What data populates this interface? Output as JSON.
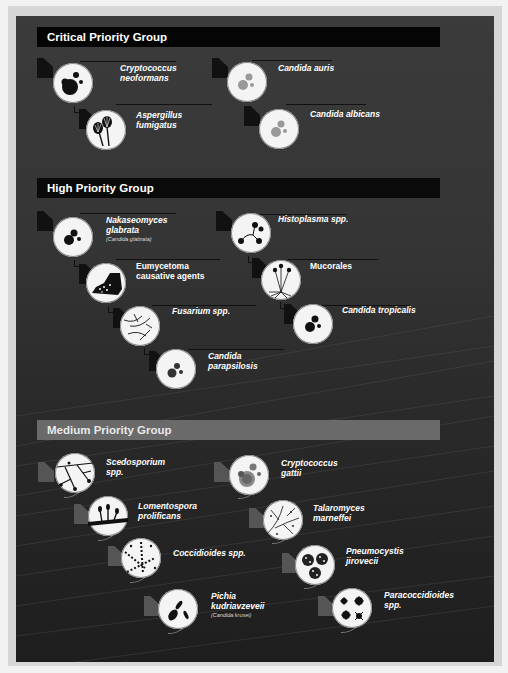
{
  "groups": [
    {
      "id": "critical",
      "title": "Critical Priority Group",
      "items": [
        {
          "name": "Cryptococcus",
          "name2": "neoformans",
          "sub": "",
          "icon": "cryptococcus-icon"
        },
        {
          "name": "Aspergillus",
          "name2": "fumigatus",
          "sub": "",
          "icon": "aspergillus-icon"
        },
        {
          "name": "Candida auris",
          "name2": "",
          "sub": "",
          "icon": "candida-icon"
        },
        {
          "name": "Candida albicans",
          "name2": "",
          "sub": "",
          "icon": "candida-icon"
        }
      ]
    },
    {
      "id": "high",
      "title": "High Priority Group",
      "items": [
        {
          "name": "Nakaseomyces",
          "name2": "glabrata",
          "sub": "(Candida glabrata)",
          "icon": "yeast-icon"
        },
        {
          "name": "Eumycetoma",
          "name2": "causative agents",
          "sub": "",
          "icon": "foot-icon"
        },
        {
          "name": "Fusarium spp.",
          "name2": "",
          "sub": "",
          "icon": "fusarium-icon"
        },
        {
          "name": "Candida",
          "name2": "parapsilosis",
          "sub": "",
          "icon": "yeast-icon"
        },
        {
          "name": "Histoplasma spp.",
          "name2": "",
          "sub": "",
          "icon": "histoplasma-icon"
        },
        {
          "name": "Mucorales",
          "name2": "",
          "sub": "",
          "icon": "mucorales-icon"
        },
        {
          "name": "Candida tropicalis",
          "name2": "",
          "sub": "",
          "icon": "yeast-icon"
        }
      ]
    },
    {
      "id": "medium",
      "title": "Medium Priority Group",
      "items": [
        {
          "name": "Scedosporium",
          "name2": "spp.",
          "sub": "",
          "icon": "scedosporium-icon"
        },
        {
          "name": "Lomentospora",
          "name2": "prolificans",
          "sub": "",
          "icon": "lomentospora-icon"
        },
        {
          "name": "Coccidioides spp.",
          "name2": "",
          "sub": "",
          "icon": "coccidioides-icon"
        },
        {
          "name": "Pichia",
          "name2": "kudriavzeveii",
          "sub": "(Candida krusei)",
          "icon": "pichia-icon"
        },
        {
          "name": "Cryptococcus",
          "name2": "gattii",
          "sub": "",
          "icon": "cryptococcus-gattii-icon"
        },
        {
          "name": "Talaromyces",
          "name2": "marneffei",
          "sub": "",
          "icon": "talaromyces-icon"
        },
        {
          "name": "Pneumocystis",
          "name2": "jirovecii",
          "sub": "",
          "icon": "pneumocystis-icon"
        },
        {
          "name": "Paracoccidioides",
          "name2": "spp.",
          "sub": "",
          "icon": "paracoccidioides-icon"
        }
      ]
    }
  ],
  "colors": {
    "panel_top": "#3b3b3b",
    "panel_bottom": "#1e1e1e",
    "critical_header": "#050505",
    "high_header": "#0a0a0a",
    "medium_header": "#6a6a6a",
    "circle_fill": "#f4f4f4"
  }
}
